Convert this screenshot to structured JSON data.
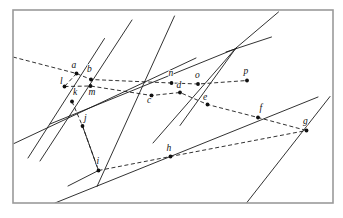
{
  "figure": {
    "canvas": {
      "width": 343,
      "height": 218
    },
    "frame": {
      "x": 13,
      "y": 10,
      "width": 320,
      "height": 193,
      "stroke": "#9a9a9a"
    },
    "colors": {
      "background": "#ffffff",
      "ink": "#1b1b1b",
      "point": "#111111",
      "frame": "#9a9a9a"
    },
    "line_styles": {
      "solid": "solid",
      "dashed": "dashed"
    },
    "points": [
      {
        "id": "a",
        "label": "a",
        "x": 76.5,
        "y": 73.5,
        "label_x": 71.5,
        "label_y": 67.5
      },
      {
        "id": "b",
        "label": "b",
        "x": 91.0,
        "y": 79.5,
        "label_x": 87.0,
        "label_y": 71.5
      },
      {
        "id": "c",
        "label": "c",
        "x": 151.5,
        "y": 95.5,
        "label_x": 147.0,
        "label_y": 102.5
      },
      {
        "id": "d",
        "label": "d",
        "x": 180.0,
        "y": 92.5,
        "label_x": 176.5,
        "label_y": 88.0
      },
      {
        "id": "e",
        "label": "e",
        "x": 207.5,
        "y": 104.5,
        "label_x": 203.0,
        "label_y": 99.5
      },
      {
        "id": "f",
        "label": "f",
        "x": 258.0,
        "y": 117.5,
        "label_x": 259.5,
        "label_y": 110.5
      },
      {
        "id": "g",
        "label": "g",
        "x": 306.5,
        "y": 130.5,
        "label_x": 303.0,
        "label_y": 124.0
      },
      {
        "id": "h",
        "label": "h",
        "x": 170.5,
        "y": 156.5,
        "label_x": 166.5,
        "label_y": 151.0
      },
      {
        "id": "i",
        "label": "i",
        "x": 98.5,
        "y": 170.5,
        "label_x": 96.5,
        "label_y": 164.0
      },
      {
        "id": "j",
        "label": "j",
        "x": 82.5,
        "y": 126.0,
        "label_x": 84.0,
        "label_y": 121.0
      },
      {
        "id": "k",
        "label": "k",
        "x": 72.0,
        "y": 101.5,
        "label_x": 73.0,
        "label_y": 95.0
      },
      {
        "id": "l",
        "label": "l",
        "x": 64.5,
        "y": 86.5,
        "label_x": 60.0,
        "label_y": 83.5
      },
      {
        "id": "m",
        "label": "m",
        "x": 90.5,
        "y": 86.0,
        "label_x": 88.5,
        "label_y": 95.0
      },
      {
        "id": "n",
        "label": "n",
        "x": 171.5,
        "y": 83.0,
        "label_x": 168.5,
        "label_y": 76.0
      },
      {
        "id": "o",
        "label": "o",
        "x": 198.0,
        "y": 84.0,
        "label_x": 195.0,
        "label_y": 77.5
      },
      {
        "id": "p",
        "label": "p",
        "x": 247.0,
        "y": 80.5,
        "label_x": 243.5,
        "label_y": 73.5
      }
    ],
    "solid_segments": [
      {
        "name": "line-through-a-k-j-i",
        "x1": 104.5,
        "y1": 38.5,
        "x2": 28.0,
        "y2": 158.0
      },
      {
        "name": "line-through-b-m-l",
        "x1": 132.0,
        "y1": 20.0,
        "x2": 40.0,
        "y2": 161.0
      },
      {
        "name": "line-through-n-d-c-lower",
        "x1": 174.5,
        "y1": 16.0,
        "x2": 97.0,
        "y2": 186.5
      },
      {
        "name": "line-through-o-e-right",
        "x1": 236.0,
        "y1": 48.0,
        "x2": 153.0,
        "y2": 143.0
      },
      {
        "name": "line-through-p-f-g-steep",
        "x1": 278.5,
        "y1": 12.0,
        "x2": 236.0,
        "y2": 48.0
      },
      {
        "name": "line-g-bottom-right",
        "x1": 236.0,
        "y1": 48.0,
        "x2": 180.0,
        "y2": 125.5
      },
      {
        "name": "line-l-m-ray-east",
        "x1": 50.0,
        "y1": 124.0,
        "x2": 236.0,
        "y2": 48.5
      },
      {
        "name": "line-lower-long-southwest",
        "x1": 13.0,
        "y1": 144.0,
        "x2": 196.0,
        "y2": 58.0
      },
      {
        "name": "line-bottom-band-to-g",
        "x1": 55.0,
        "y1": 203.0,
        "x2": 318.0,
        "y2": 97.0
      },
      {
        "name": "line-g-steep-bottom",
        "x1": 330.0,
        "y1": 96.5,
        "x2": 246.5,
        "y2": 203.0
      },
      {
        "name": "line-j-i-through-lower",
        "x1": 82.5,
        "y1": 126.0,
        "x2": 98.5,
        "y2": 170.5
      },
      {
        "name": "line-i-ray-southwest",
        "x1": 98.5,
        "y1": 170.5,
        "x2": 68.0,
        "y2": 186.0
      },
      {
        "name": "line-right-upper-short",
        "x1": 226.0,
        "y1": 52.0,
        "x2": 271.5,
        "y2": 37.0
      }
    ],
    "dashed_segments": [
      {
        "name": "dash-left-edge-to-a-b-n-o-p",
        "points": "13,57 76.5,73.5 91,79.5 171.5,83 198,84 247,80.5"
      },
      {
        "name": "dash-l-m-c-d-e-f-g",
        "points": "64.5,86.5 90.5,86 151.5,95.5 180,92.5 207.5,104.5 258,117.5 306.5,130.5"
      },
      {
        "name": "dash-k-j-i",
        "points": "72,101.5 82.5,126 98.5,170.5"
      },
      {
        "name": "dash-i-h-g",
        "points": "98.5,170.5 170.5,156.5 306.5,130.5"
      },
      {
        "name": "dash-a-l",
        "points": "76.5,73.5 64.5,86.5"
      }
    ]
  }
}
